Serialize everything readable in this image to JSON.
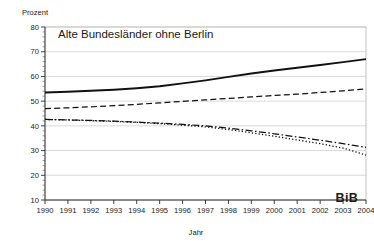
{
  "chart_data": {
    "type": "line",
    "title": "Alte Bundesländer ohne Berlin",
    "xlabel": "Jahr",
    "ylabel": "Prozent",
    "xlim": [
      1990,
      2004
    ],
    "ylim": [
      10,
      80
    ],
    "ytick_step": 10,
    "yminor_step": 2,
    "grid": true,
    "legend": null,
    "x": [
      1990,
      1991,
      1992,
      1993,
      1994,
      1995,
      1996,
      1997,
      1998,
      1999,
      2000,
      2001,
      2002,
      2003,
      2004
    ],
    "categories": [
      "1990",
      "1991",
      "1992",
      "1993",
      "1994",
      "1995",
      "1996",
      "1997",
      "1998",
      "1999",
      "2000",
      "2001",
      "2002",
      "2003",
      "2004"
    ],
    "yticks": [
      10,
      20,
      30,
      40,
      50,
      60,
      70,
      80
    ],
    "ytick_labels": [
      "10",
      "20",
      "30",
      "40",
      "50",
      "60",
      "70",
      "80"
    ],
    "series": [
      {
        "name": "Serie 1",
        "style": "solid",
        "values": [
          53.5,
          53.8,
          54.2,
          54.6,
          55.2,
          56.0,
          57.2,
          58.4,
          59.8,
          61.2,
          62.4,
          63.5,
          64.6,
          65.8,
          67.0
        ]
      },
      {
        "name": "Serie 2",
        "style": "dashed",
        "values": [
          47.0,
          47.3,
          47.7,
          48.2,
          48.7,
          49.3,
          49.9,
          50.5,
          51.1,
          51.7,
          52.3,
          52.8,
          53.5,
          54.2,
          55.0
        ]
      },
      {
        "name": "Serie 3",
        "style": "dashdot",
        "values": [
          42.6,
          42.4,
          42.2,
          41.9,
          41.5,
          41.1,
          40.6,
          40.0,
          39.1,
          38.0,
          36.8,
          35.5,
          34.2,
          32.8,
          31.3
        ]
      },
      {
        "name": "Serie 4",
        "style": "dotted",
        "values": [
          42.6,
          42.4,
          42.1,
          41.8,
          41.4,
          40.9,
          40.3,
          39.6,
          38.5,
          37.2,
          35.8,
          34.3,
          32.8,
          31.0,
          28.2
        ]
      }
    ],
    "annotations": [
      {
        "name": "logo",
        "text": "BiB"
      }
    ]
  },
  "logo": {
    "text": "BiB"
  },
  "colors": {
    "background": "#ffffff",
    "line": "#111111",
    "grid": "#c9c9c9",
    "axis": "#2b2b2b",
    "text": "#1a1a1a"
  }
}
